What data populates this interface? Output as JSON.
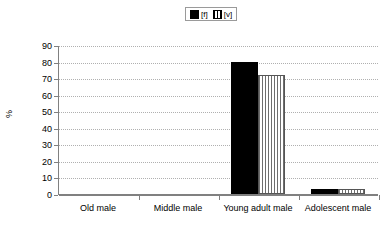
{
  "chart_data": {
    "type": "bar",
    "title": "",
    "xlabel": "",
    "ylabel": "%",
    "ylim": [
      0,
      90
    ],
    "yticks": [
      0,
      10,
      20,
      30,
      40,
      50,
      60,
      70,
      80,
      90
    ],
    "grid": true,
    "legend_position": "top-center",
    "categories": [
      "Old male",
      "Middle male",
      "Young adult male",
      "Adolescent male"
    ],
    "series": [
      {
        "name": "[f]",
        "swatch": "solid-black-square",
        "color": "#000000",
        "values": [
          0,
          0,
          80,
          3
        ]
      },
      {
        "name": "[v]",
        "swatch": "vertical-hatch-square",
        "color": "#ffffff",
        "values": [
          0,
          0,
          72,
          3
        ]
      }
    ]
  },
  "legend": {
    "items": [
      {
        "label": "[f]",
        "icon": "solid-square-icon"
      },
      {
        "label": "[v]",
        "icon": "hatched-square-icon"
      }
    ]
  },
  "axes": {
    "y_title": "%",
    "y_ticks": [
      "90",
      "80",
      "70",
      "60",
      "50",
      "40",
      "30",
      "20",
      "10",
      "0"
    ],
    "x_categories": [
      "Old male",
      "Middle male",
      "Young adult male",
      "Adolescent male"
    ]
  }
}
